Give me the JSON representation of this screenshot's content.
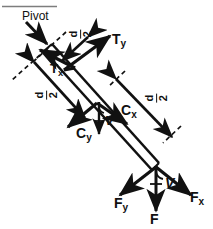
{
  "figure": {
    "background_color": "#ffffff",
    "ink_color": "#111111",
    "width": 213,
    "height": 229
  },
  "labels": {
    "pivot": "Pivot",
    "t_y": "T",
    "t_y_sub": "y",
    "t_x": "T",
    "t_x_sub": "x",
    "c_x": "C",
    "c_x_sub": "x",
    "c_y": "C",
    "c_y_sub": "y",
    "f_x": "F",
    "f_x_sub": "x",
    "f_y": "F",
    "f_y_sub": "y",
    "f": "F",
    "v_mid": "V",
    "v_bottom": "V"
  },
  "dimensions": [
    {
      "name": "d-over-2-top",
      "numerator": "d",
      "denominator": "2"
    },
    {
      "name": "d-over-2-left",
      "numerator": "d",
      "denominator": "2"
    },
    {
      "name": "d-over-2-right",
      "numerator": "d",
      "denominator": "2"
    }
  ],
  "vectors": [
    {
      "name": "pivot-pointer",
      "label": "Pivot"
    },
    {
      "name": "tension-y-arrow",
      "label": "Ty"
    },
    {
      "name": "tension-x-arrow",
      "label": "Tx"
    },
    {
      "name": "compression-x-arrow",
      "label": "Cx"
    },
    {
      "name": "compression-y-arrow",
      "label": "Cy"
    },
    {
      "name": "shear-mid-arrow",
      "label": "V"
    },
    {
      "name": "force-x-arrow",
      "label": "Fx"
    },
    {
      "name": "force-y-arrow",
      "label": "Fy"
    },
    {
      "name": "force-resultant-arrow",
      "label": "F"
    },
    {
      "name": "shear-bottom-arrow",
      "label": "V"
    }
  ]
}
